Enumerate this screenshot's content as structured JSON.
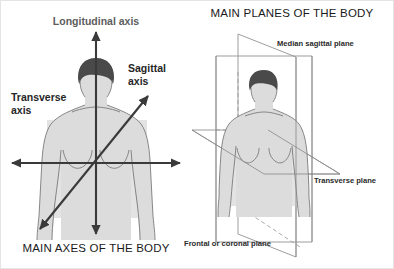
{
  "image": {
    "background_color": "#ffffff",
    "width": 394,
    "height": 269,
    "border_color": "#e4e4e4"
  },
  "left_panel": {
    "title": "MAIN AXES OF THE BODY",
    "title_color": "#1a1a1a",
    "subject": "anterior view of male torso and head silhouette",
    "labels": {
      "longitudinal": "Longitudinal axis",
      "sagittal_line1": "Sagittal",
      "sagittal_line2": "axis",
      "transverse_line1": "Transverse",
      "transverse_line2": "axis"
    },
    "label_colors": {
      "longitudinal": "#5d5d5d",
      "sagittal": "#262626",
      "transverse": "#262626"
    },
    "axes": [
      {
        "name": "longitudinal-axis",
        "orientation": "vertical",
        "arrowheads": "both",
        "color": "#3a3a3a"
      },
      {
        "name": "transverse-axis",
        "orientation": "horizontal",
        "arrowheads": "both",
        "color": "#3a3a3a"
      },
      {
        "name": "sagittal-axis",
        "orientation": "diagonal",
        "arrowheads": "both",
        "color": "#3a3a3a"
      }
    ]
  },
  "right_panel": {
    "title": "MAIN PLANES OF THE BODY",
    "title_color": "#1a1a1a",
    "subject": "anterior view of male torso and head silhouette",
    "labels": {
      "median_sagittal": "Median sagittal plane",
      "transverse": "Transverse plane",
      "frontal": "Frontal or coronal plane"
    },
    "label_color": "#2b2b2b",
    "planes": [
      {
        "name": "median-sagittal-plane",
        "label": "Median sagittal plane",
        "shape": "parallelogram",
        "orientation": "vertical, front-to-back through midline"
      },
      {
        "name": "transverse-plane",
        "label": "Transverse plane",
        "shape": "parallelogram",
        "orientation": "horizontal, chest level"
      },
      {
        "name": "frontal-coronal-plane",
        "label": "Frontal or coronal plane",
        "shape": "rectangle",
        "orientation": "vertical, side-to-side"
      }
    ],
    "plane_edge_color": "#8d8d8d"
  },
  "figure_colors": {
    "skin": "#dcdcdc",
    "skin_soft": "#e3e3e3",
    "hair": "#4a4a4a",
    "outline": "#7a7a7a"
  }
}
